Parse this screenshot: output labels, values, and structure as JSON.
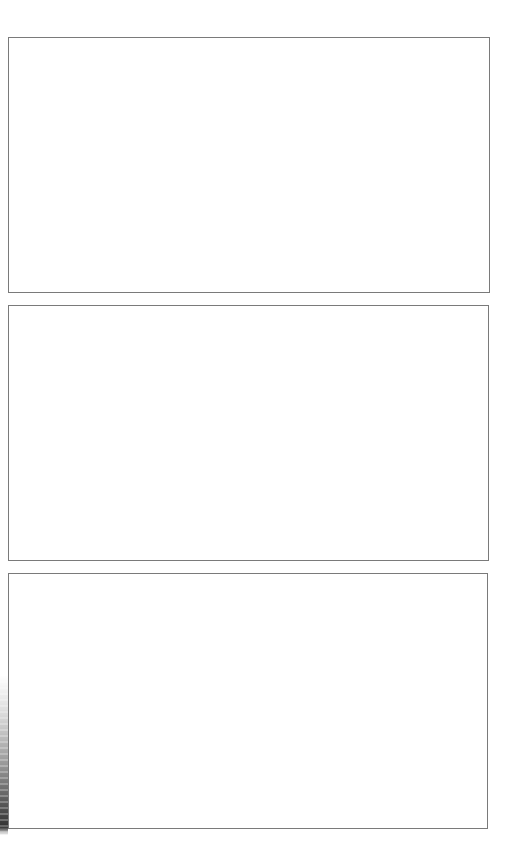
{
  "page": {
    "background_color": "#ffffff",
    "border_color": "#7a7a7a"
  },
  "frames": [
    {
      "label": ""
    },
    {
      "label": ""
    },
    {
      "label": ""
    }
  ],
  "artifacts": {
    "left_edge_scan_shadow": true
  }
}
